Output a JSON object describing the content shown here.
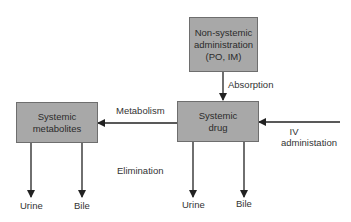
{
  "diagram": {
    "nodes": {
      "non_systemic": {
        "label": "Non-systemic administration (PO, IM)"
      },
      "systemic_drug": {
        "label": "Systemic drug"
      },
      "systemic_metabolites": {
        "label": "Systemic metabolites"
      }
    },
    "edge_labels": {
      "absorption": "Absorption",
      "metabolism": "Metabolism",
      "iv": "IV",
      "iv_line2": "administation",
      "elimination": "Elimination"
    },
    "outputs": {
      "metabolites_urine": "Urine",
      "metabolites_bile": "Bile",
      "drug_urine": "Urine",
      "drug_bile": "Bile"
    },
    "colors": {
      "box_fill": "#a8a8a8",
      "box_border": "#6e6e6e",
      "line": "#222222"
    }
  }
}
